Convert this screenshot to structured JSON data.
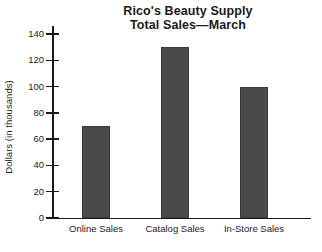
{
  "chart_data": {
    "type": "bar",
    "title": "Rico's Beauty Supply\nTotal Sales—March",
    "title_line1": "Rico's Beauty Supply",
    "title_line2": "Total Sales—March",
    "categories": [
      "Online Sales",
      "Catalog Sales",
      "In-Store Sales"
    ],
    "values": [
      70,
      130,
      100
    ],
    "xlabel": "",
    "ylabel": "Dollars (in thousands)",
    "ylim": [
      0,
      140
    ],
    "ytick_step": 20,
    "ytick_labels": [
      "0",
      "20",
      "40",
      "60",
      "80",
      "100",
      "120",
      "140"
    ],
    "ytick_values": [
      0,
      20,
      40,
      60,
      80,
      100,
      120,
      140
    ],
    "grid": false,
    "legend": false,
    "bar_color": "#4a4a4a",
    "axis_color": "#1a1a1a",
    "background": "#ffffff"
  }
}
